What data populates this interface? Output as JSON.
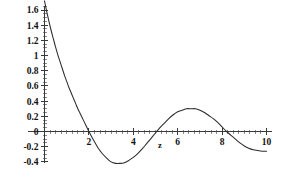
{
  "chart_data": {
    "type": "line",
    "title": "",
    "subtitle": "",
    "xlabel": "z",
    "ylabel": "",
    "xlim": [
      0,
      10
    ],
    "ylim": [
      -0.45,
      1.72
    ],
    "grid": false,
    "legend": null,
    "x_ticks": [
      2,
      4,
      6,
      8,
      10
    ],
    "x_tick_labels": [
      "2",
      "4",
      "6",
      "8",
      "10"
    ],
    "x_minor_tick_step": 0.25,
    "y_ticks": [
      -0.4,
      -0.2,
      0,
      0.2,
      0.4,
      0.6,
      0.8,
      1,
      1.2,
      1.4,
      1.6
    ],
    "y_tick_labels": [
      "-0.4",
      "-0.2",
      "0",
      "0.2",
      "0.4",
      "0.6",
      "0.8",
      "1",
      "1.2",
      "1.4",
      "1.6"
    ],
    "y_minor_tick_step": 0.05,
    "annotations": [],
    "series": [
      {
        "name": "damped-oscillation",
        "color": "#2b2b2b",
        "x": [
          0.0,
          0.1,
          0.2,
          0.3,
          0.4,
          0.5,
          0.6,
          0.7,
          0.8,
          0.9,
          1.0,
          1.1,
          1.2,
          1.3,
          1.4,
          1.5,
          1.6,
          1.7,
          1.8,
          1.9,
          2.0,
          2.2,
          2.4,
          2.6,
          2.8,
          3.0,
          3.2,
          3.4,
          3.6,
          3.8,
          4.0,
          4.2,
          4.4,
          4.6,
          4.8,
          5.0,
          5.2,
          5.4,
          5.6,
          5.8,
          6.0,
          6.2,
          6.4,
          6.6,
          6.8,
          7.0,
          7.2,
          7.4,
          7.6,
          7.8,
          8.0,
          8.2,
          8.4,
          8.6,
          8.8,
          9.0,
          9.2,
          9.4,
          9.6,
          9.8,
          10.0
        ],
        "y": [
          1.72,
          1.58,
          1.45,
          1.33,
          1.22,
          1.11,
          1.01,
          0.92,
          0.83,
          0.74,
          0.66,
          0.58,
          0.51,
          0.44,
          0.37,
          0.3,
          0.24,
          0.18,
          0.12,
          0.06,
          0.0,
          -0.11,
          -0.21,
          -0.29,
          -0.35,
          -0.4,
          -0.42,
          -0.42,
          -0.41,
          -0.38,
          -0.34,
          -0.29,
          -0.23,
          -0.16,
          -0.09,
          -0.02,
          0.05,
          0.11,
          0.17,
          0.22,
          0.26,
          0.28,
          0.3,
          0.3,
          0.3,
          0.28,
          0.25,
          0.21,
          0.17,
          0.12,
          0.06,
          0.0,
          -0.05,
          -0.1,
          -0.15,
          -0.19,
          -0.22,
          -0.24,
          -0.25,
          -0.26,
          -0.26
        ],
        "zero_crossings": [
          1.95,
          5.1,
          8.2
        ],
        "minimum": {
          "x": 3.3,
          "y": -0.42
        },
        "maximum_interior": {
          "x": 6.65,
          "y": 0.3
        },
        "start_value": 1.72,
        "end_value": -0.26
      }
    ]
  }
}
